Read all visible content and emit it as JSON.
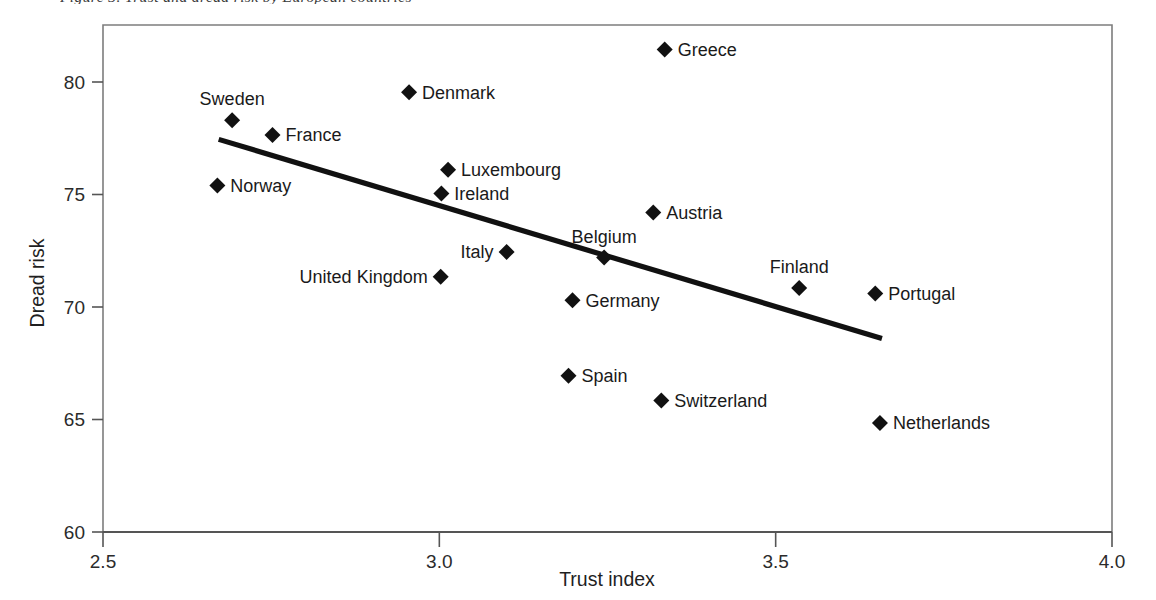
{
  "caption": {
    "text": "Figure 3. Trust and dread risk by European countries"
  },
  "chart_data": {
    "type": "scatter",
    "title": "Figure 3. Trust and dread risk by European countries",
    "xlabel": "Trust index",
    "ylabel": "Dread risk",
    "xlim": [
      2.5,
      4.0
    ],
    "ylim": [
      60,
      82.5
    ],
    "xticks": [
      "2.5",
      "3.0",
      "3.5",
      "4.0"
    ],
    "xtick_values": [
      2.5,
      3.0,
      3.5,
      4.0
    ],
    "yticks": [
      "60",
      "65",
      "70",
      "75",
      "80"
    ],
    "ytick_values": [
      60,
      65,
      70,
      75,
      80
    ],
    "grid": false,
    "legend": "none",
    "marker": "diamond",
    "marker_color": "#111111",
    "points": [
      {
        "label": "Greece",
        "x": 3.335,
        "y": 81.45,
        "label_pos": "right"
      },
      {
        "label": "Denmark",
        "x": 2.955,
        "y": 79.55,
        "label_pos": "right"
      },
      {
        "label": "Sweden",
        "x": 2.692,
        "y": 78.3,
        "label_pos": "above"
      },
      {
        "label": "France",
        "x": 2.752,
        "y": 77.65,
        "label_pos": "right"
      },
      {
        "label": "Luxembourg",
        "x": 3.013,
        "y": 76.1,
        "label_pos": "right"
      },
      {
        "label": "Norway",
        "x": 2.67,
        "y": 75.4,
        "label_pos": "right"
      },
      {
        "label": "Ireland",
        "x": 3.003,
        "y": 75.05,
        "label_pos": "right"
      },
      {
        "label": "Austria",
        "x": 3.318,
        "y": 74.2,
        "label_pos": "right"
      },
      {
        "label": "Italy",
        "x": 3.1,
        "y": 72.45,
        "label_pos": "left"
      },
      {
        "label": "Belgium",
        "x": 3.245,
        "y": 72.2,
        "label_pos": "above"
      },
      {
        "label": "United Kingdom",
        "x": 3.002,
        "y": 71.35,
        "label_pos": "left"
      },
      {
        "label": "Finland",
        "x": 3.535,
        "y": 70.85,
        "label_pos": "above"
      },
      {
        "label": "Portugal",
        "x": 3.648,
        "y": 70.6,
        "label_pos": "right"
      },
      {
        "label": "Germany",
        "x": 3.198,
        "y": 70.3,
        "label_pos": "right"
      },
      {
        "label": "Spain",
        "x": 3.192,
        "y": 66.95,
        "label_pos": "right"
      },
      {
        "label": "Switzerland",
        "x": 3.33,
        "y": 65.85,
        "label_pos": "right"
      },
      {
        "label": "Netherlands",
        "x": 3.655,
        "y": 64.85,
        "label_pos": "right"
      }
    ],
    "trend_line": {
      "x_start": 2.672,
      "y_start": 77.45,
      "x_end": 3.658,
      "y_end": 68.6
    }
  }
}
